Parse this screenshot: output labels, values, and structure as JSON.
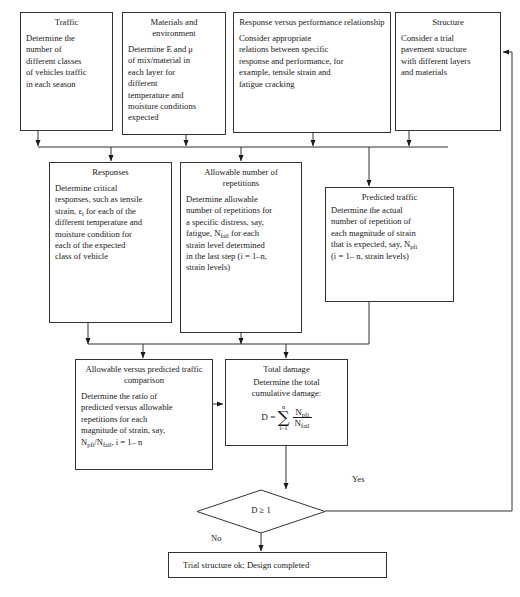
{
  "diagram": {
    "nodes": {
      "traffic": {
        "title": "Traffic",
        "body": "Determine the\nnumber of\ndifferent classes\nof vehicles traffic\nin each season"
      },
      "materials": {
        "title": "Materials and\nenvironment",
        "body": "Determine E and μ\nof mix/material in\neach layer for\ndifferent\ntemperature and\nmoisture conditions\nexpected"
      },
      "response_perf": {
        "title": "Response versus performance\nrelationship",
        "body": "Consider appropriate\nrelations between specific\nresponse and performance, for\nexample, tensile strain and\nfatigue cracking"
      },
      "structure": {
        "title": "Structure",
        "body": "Consider a trial\npavement structure\nwith different layers\nand materials"
      },
      "responses": {
        "title": "Responses",
        "body_pre": "Determine critical\nresponses, such as tensile\nstrain, ε",
        "body_sub": "t",
        "body_post": " for each of the\ndifferent temperature and\nmoisture condition for\neach of the expected\nclass of vehicle"
      },
      "allowable_reps": {
        "title": "Allowable number of\nrepetitions",
        "body_pre": "Determine allowable\nnumber of repetitions for\na specific distress, say,\nfatigue, N",
        "body_sub": "fail",
        "body_post": " for each\nstrain level determined\nin the last step (i = 1–n,\nstrain levels)"
      },
      "predicted_traffic": {
        "title": "Predicted traffic",
        "body_pre": "Determine the actual\nnumber of repetition of\neach magnitude of strain\nthat is expected, say, N",
        "body_sub": "pfi",
        "body_post": "\n(i = 1– n, strain levels)"
      },
      "comparison": {
        "title": "Allowable versus predicted\ntraffic comparison",
        "body_pre": "Determine the ratio of\npredicted versus allowable\nrepetitions for each\nmagnitude of strain, say,\nN",
        "body_sub1": "pfi",
        "body_mid": "/N",
        "body_sub2": "fail",
        "body_post": ",  i = 1– n"
      },
      "total_damage": {
        "title": "Total damage",
        "body": "Determine the total\ncumulative damage:",
        "formula": {
          "lhs": "D =",
          "sum_upper": "n",
          "sum_symbol": "∑",
          "sum_lower": "i–1",
          "numerator": "N",
          "numerator_sub": "pfi",
          "denominator": "N",
          "denominator_sub": "fail"
        }
      },
      "decision": {
        "label": "D ≥ 1"
      },
      "final": {
        "label": "Trial structure ok; Design completed"
      }
    },
    "edge_labels": {
      "yes": "Yes",
      "no": "No"
    },
    "colors": {
      "stroke": "#333333",
      "text": "#1a1a1a",
      "background": "#ffffff"
    }
  }
}
